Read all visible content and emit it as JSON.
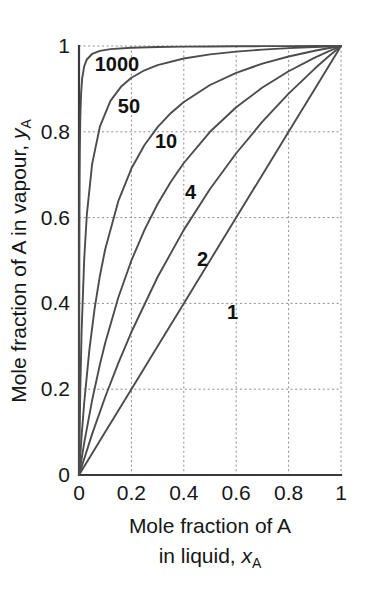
{
  "chart_data": {
    "type": "line",
    "title": "",
    "subtitle": "",
    "xlabel_line1": "Mole fraction of A",
    "xlabel_line2_prefix": "in liquid, ",
    "xlabel_symbol": "x",
    "xlabel_subscript": "A",
    "ylabel_prefix": "Mole fraction of A in vapour, ",
    "ylabel_symbol": "y",
    "ylabel_subscript": "A",
    "xlim": [
      0,
      1
    ],
    "ylim": [
      0,
      1
    ],
    "xticks": [
      0,
      0.2,
      0.4,
      0.6,
      0.8,
      1
    ],
    "yticks": [
      0,
      0.2,
      0.4,
      0.6,
      0.8,
      1
    ],
    "xtick_labels": [
      "0",
      "0.2",
      "0.4",
      "0.6",
      "0.8",
      "1"
    ],
    "ytick_labels": [
      "0",
      "0.2",
      "0.4",
      "0.6",
      "0.8",
      "1"
    ],
    "grid": true,
    "grid_style": "dotted",
    "legend_position": "inline-labels",
    "equation": "y = alpha*x / (1 + (alpha - 1)*x)",
    "line_color": "#4c4c4c",
    "grid_color": "#8d8d8d",
    "axis_color": "#3a3a3a",
    "series": [
      {
        "name": "1000",
        "alpha": 1000,
        "label": "1000",
        "label_x": 0.06,
        "label_y": 0.955,
        "x": [
          0,
          0.0005,
          0.001,
          0.002,
          0.003,
          0.005,
          0.008,
          0.012,
          0.02,
          0.03,
          0.05,
          0.08,
          0.12,
          0.2,
          0.3,
          0.4,
          0.5,
          0.6,
          0.7,
          0.8,
          0.9,
          0.95,
          1
        ],
        "y": [
          0,
          0.3334,
          0.5002,
          0.6669,
          0.7502,
          0.8339,
          0.8895,
          0.9239,
          0.9533,
          0.9686,
          0.9814,
          0.9885,
          0.9927,
          0.996,
          0.9977,
          0.9985,
          0.999,
          0.9993,
          0.9996,
          0.9998,
          0.9999,
          0.99995,
          1
        ]
      },
      {
        "name": "50",
        "alpha": 50,
        "label": "50",
        "label_x": 0.148,
        "label_y": 0.856,
        "x": [
          0,
          0.005,
          0.01,
          0.02,
          0.03,
          0.05,
          0.08,
          0.12,
          0.16,
          0.2,
          0.25,
          0.3,
          0.4,
          0.5,
          0.6,
          0.7,
          0.8,
          0.9,
          0.95,
          1
        ],
        "y": [
          0,
          0.2008,
          0.3356,
          0.5051,
          0.6073,
          0.7246,
          0.8129,
          0.8721,
          0.9048,
          0.9259,
          0.9434,
          0.9554,
          0.9709,
          0.9804,
          0.9868,
          0.9915,
          0.9951,
          0.9978,
          0.999,
          1
        ]
      },
      {
        "name": "10",
        "alpha": 10,
        "label": "10",
        "label_x": 0.29,
        "label_y": 0.775,
        "x": [
          0,
          0.01,
          0.02,
          0.04,
          0.06,
          0.08,
          0.1,
          0.15,
          0.2,
          0.25,
          0.3,
          0.35,
          0.4,
          0.5,
          0.6,
          0.7,
          0.8,
          0.9,
          0.95,
          1
        ],
        "y": [
          0,
          0.0917,
          0.1695,
          0.2941,
          0.3896,
          0.4651,
          0.5263,
          0.6383,
          0.7143,
          0.7692,
          0.8108,
          0.8434,
          0.8696,
          0.9091,
          0.9375,
          0.9589,
          0.9756,
          0.989,
          0.9948,
          1
        ]
      },
      {
        "name": "4",
        "alpha": 4,
        "label": "4",
        "label_x": 0.405,
        "label_y": 0.655,
        "x": [
          0,
          0.02,
          0.05,
          0.08,
          0.1,
          0.15,
          0.2,
          0.25,
          0.3,
          0.35,
          0.4,
          0.5,
          0.6,
          0.7,
          0.8,
          0.9,
          0.95,
          1
        ],
        "y": [
          0,
          0.0755,
          0.1739,
          0.2581,
          0.3077,
          0.4138,
          0.5,
          0.5714,
          0.6316,
          0.683,
          0.7273,
          0.8,
          0.8571,
          0.9032,
          0.9412,
          0.973,
          0.987,
          1
        ]
      },
      {
        "name": "2",
        "alpha": 2,
        "label": "2",
        "label_x": 0.45,
        "label_y": 0.5,
        "x": [
          0,
          0.05,
          0.1,
          0.15,
          0.2,
          0.3,
          0.4,
          0.5,
          0.6,
          0.7,
          0.8,
          0.9,
          0.95,
          1
        ],
        "y": [
          0,
          0.0952,
          0.1818,
          0.2609,
          0.3333,
          0.4615,
          0.5714,
          0.6667,
          0.75,
          0.8235,
          0.8889,
          0.9474,
          0.9744,
          1
        ]
      },
      {
        "name": "1",
        "alpha": 1,
        "label": "1",
        "label_x": 0.565,
        "label_y": 0.375,
        "x": [
          0,
          0.1,
          0.2,
          0.3,
          0.4,
          0.5,
          0.6,
          0.7,
          0.8,
          0.9,
          1
        ],
        "y": [
          0,
          0.1,
          0.2,
          0.3,
          0.4,
          0.5,
          0.6,
          0.7,
          0.8,
          0.9,
          1
        ]
      }
    ]
  }
}
